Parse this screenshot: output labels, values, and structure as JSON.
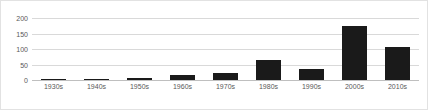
{
  "chart_data": {
    "type": "bar",
    "title": "",
    "xlabel": "",
    "ylabel": "",
    "categories": [
      "1930s",
      "1940s",
      "1950s",
      "1960s",
      "1970s",
      "1980s",
      "1990s",
      "2000s",
      "2010s"
    ],
    "values": [
      2,
      4,
      5,
      15,
      22,
      65,
      35,
      175,
      105
    ],
    "series": [
      {
        "name": "",
        "values": [
          2,
          4,
          5,
          15,
          22,
          65,
          35,
          175,
          105
        ]
      }
    ],
    "ylim": [
      0,
      200
    ],
    "yticks": [
      0,
      50,
      100,
      150,
      200
    ],
    "ytick_labels": [
      "0",
      "50",
      "100",
      "150",
      "200"
    ],
    "grid": true,
    "legend": false,
    "legend_position": "none",
    "bar_color": "#1a1a1a",
    "gridline_color": "#d9d9d9",
    "axis_color": "#bfbfbf",
    "background_color": "#ffffff",
    "border_color": "#e2e2e2",
    "tick_label_color": "#595959"
  }
}
